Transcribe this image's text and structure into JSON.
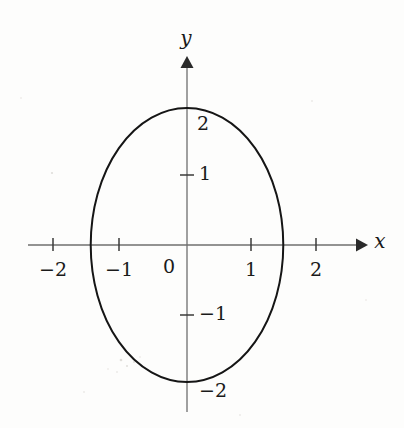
{
  "figure": {
    "title": "",
    "background_color": "#fdfdfc",
    "curve_color": "#151515",
    "axis_color": "#6f6f6f",
    "label_color": "#1a1a1a"
  },
  "axes": {
    "x_label": "x",
    "y_label": "y",
    "origin_label": "0",
    "x_ticks": [
      {
        "value": -2,
        "label": "−2",
        "px": 53
      },
      {
        "value": -1,
        "label": "−1",
        "px": 119
      },
      {
        "value": 1,
        "label": "1",
        "px": 251
      },
      {
        "value": 2,
        "label": "2",
        "px": 316
      }
    ],
    "y_ticks": [
      {
        "value": 2,
        "label": "2",
        "px": 108,
        "has_mark": false
      },
      {
        "value": 1,
        "label": "1",
        "px": 175,
        "has_mark": true
      },
      {
        "value": -1,
        "label": "−1",
        "px": 315,
        "has_mark": true
      },
      {
        "value": -2,
        "label": "−2",
        "px": 382,
        "has_mark": false
      }
    ],
    "origin_px": {
      "x": 187,
      "y": 245
    },
    "unit_px": {
      "x": 65.5,
      "y": 68.5
    },
    "x_range": [
      -2.4,
      2.7
    ],
    "y_range": [
      -2.4,
      2.7
    ],
    "grid": false
  },
  "chart_data": {
    "type": "line",
    "title": "",
    "xlabel": "x",
    "ylabel": "y",
    "xlim": [
      -2.4,
      2.7
    ],
    "ylim": [
      -2.4,
      2.7
    ],
    "grid": false,
    "legend": "none",
    "xticks": [
      -2,
      -1,
      0,
      1,
      2
    ],
    "xticklabels": [
      "−2",
      "−1",
      "0",
      "1",
      "2"
    ],
    "yticks": [
      -2,
      -1,
      1,
      2
    ],
    "yticklabels": [
      "−2",
      "−1",
      "1",
      "2"
    ],
    "series": [
      {
        "name": "ellipse",
        "kind": "closed-curve",
        "shape": "ellipse",
        "center": [
          0,
          0
        ],
        "semi_axis_x": 1.47,
        "semi_axis_y": 2.0,
        "x_intercepts": [
          -1.47,
          1.47
        ],
        "y_intercepts": [
          -2.0,
          2.0
        ],
        "equation": "x^2/2 + y^2/4 = 1",
        "color": "#151515",
        "linewidth": 2.0,
        "x": [
          1.47,
          1.42,
          1.27,
          1.04,
          0.73,
          0.38,
          0.0,
          -0.38,
          -0.73,
          -1.04,
          -1.27,
          -1.42,
          -1.47,
          -1.42,
          -1.27,
          -1.04,
          -0.73,
          -0.38,
          0.0,
          0.38,
          0.73,
          1.04,
          1.27,
          1.42,
          1.47
        ],
        "y": [
          0.0,
          0.52,
          1.0,
          1.41,
          1.73,
          1.93,
          2.0,
          1.93,
          1.73,
          1.41,
          1.0,
          0.52,
          0.0,
          -0.52,
          -1.0,
          -1.41,
          -1.73,
          -1.93,
          -2.0,
          -1.93,
          -1.73,
          -1.41,
          -1.0,
          -0.52,
          0.0
        ]
      }
    ]
  }
}
